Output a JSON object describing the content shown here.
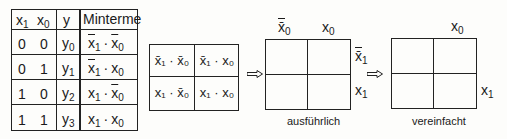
{
  "truth_table": {
    "headers": {
      "x1": "x",
      "x1_sub": "1",
      "x0": "x",
      "x0_sub": "0",
      "y": "y",
      "minterme": "Minterme"
    },
    "rows": [
      {
        "x1": "0",
        "x0": "0",
        "y": "y",
        "y_sub": "0",
        "m1": "x",
        "m1_sub": "1",
        "m1_neg": true,
        "m0": "x",
        "m0_sub": "0",
        "m0_neg": true
      },
      {
        "x1": "0",
        "x0": "1",
        "y": "y",
        "y_sub": "1",
        "m1": "x",
        "m1_sub": "1",
        "m1_neg": true,
        "m0": "x",
        "m0_sub": "0",
        "m0_neg": false
      },
      {
        "x1": "1",
        "x0": "0",
        "y": "y",
        "y_sub": "2",
        "m1": "x",
        "m1_sub": "1",
        "m1_neg": false,
        "m0": "x",
        "m0_sub": "0",
        "m0_neg": true
      },
      {
        "x1": "1",
        "x0": "1",
        "y": "y",
        "y_sub": "3",
        "m1": "x",
        "m1_sub": "1",
        "m1_neg": false,
        "m0": "x",
        "m0_sub": "0",
        "m0_neg": false
      }
    ],
    "dot": "·"
  },
  "kmap_terms": {
    "cells": [
      "x̄₁ · x̄₀",
      "x̄₁ · x₀",
      "x₁ · x̄₀",
      "x₁ · x₀"
    ]
  },
  "kmap_detailed": {
    "col_labels": [
      "x̄",
      "x"
    ],
    "col_subs": [
      "0",
      "0"
    ],
    "row_labels": [
      "x̄",
      "x"
    ],
    "row_subs": [
      "1",
      "1"
    ],
    "caption": "ausführlich"
  },
  "kmap_simplified": {
    "col_label": "x",
    "col_sub": "0",
    "row_label": "x",
    "row_sub": "1",
    "caption": "vereinfacht"
  },
  "arrows": [
    "implies-arrow",
    "implies-arrow"
  ],
  "colors": {
    "line": "#222222",
    "background": "#fdfdfb"
  }
}
